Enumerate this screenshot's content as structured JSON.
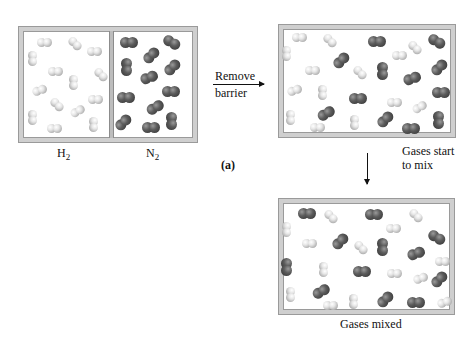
{
  "figure": {
    "panel_label": "(a)",
    "step1": {
      "label_line1": "Remove",
      "label_line2": "barrier"
    },
    "step2": {
      "label_line1": "Gases start",
      "label_line2": "to mix"
    },
    "final_caption": "Gases mixed",
    "initial_labels": {
      "left_gas": "H",
      "left_sub": "2",
      "right_gas": "N",
      "right_sub": "2"
    }
  },
  "colors": {
    "hydrogen": "#e0e0e0",
    "nitrogen": "#4a4a4a",
    "box_frame": "#cfcfcf"
  },
  "boxes": {
    "initial": {
      "x": 19,
      "y": 27,
      "w": 178,
      "h": 115,
      "divider_x": 90,
      "molecules": [
        {
          "t": "h",
          "x": 25,
          "y": 15,
          "a": 0
        },
        {
          "t": "h",
          "x": 56,
          "y": 16,
          "a": 45
        },
        {
          "t": "h",
          "x": 75,
          "y": 24,
          "a": 0
        },
        {
          "t": "h",
          "x": 14,
          "y": 31,
          "a": 90
        },
        {
          "t": "h",
          "x": 36,
          "y": 44,
          "a": 0
        },
        {
          "t": "h",
          "x": 82,
          "y": 47,
          "a": 45
        },
        {
          "t": "h",
          "x": 55,
          "y": 55,
          "a": 90
        },
        {
          "t": "h",
          "x": 20,
          "y": 63,
          "a": -20
        },
        {
          "t": "h",
          "x": 76,
          "y": 72,
          "a": 0
        },
        {
          "t": "h",
          "x": 38,
          "y": 77,
          "a": 45
        },
        {
          "t": "h",
          "x": 58,
          "y": 84,
          "a": -30
        },
        {
          "t": "h",
          "x": 14,
          "y": 90,
          "a": 90
        },
        {
          "t": "h",
          "x": 35,
          "y": 101,
          "a": 0
        },
        {
          "t": "h",
          "x": 75,
          "y": 97,
          "a": 90
        },
        {
          "t": "n",
          "x": 110,
          "y": 15,
          "a": 0
        },
        {
          "t": "n",
          "x": 153,
          "y": 15,
          "a": 30
        },
        {
          "t": "n",
          "x": 132,
          "y": 28,
          "a": -45
        },
        {
          "t": "n",
          "x": 108,
          "y": 40,
          "a": 90
        },
        {
          "t": "n",
          "x": 153,
          "y": 40,
          "a": -45
        },
        {
          "t": "n",
          "x": 130,
          "y": 50,
          "a": -20
        },
        {
          "t": "n",
          "x": 152,
          "y": 64,
          "a": 0
        },
        {
          "t": "n",
          "x": 107,
          "y": 70,
          "a": 0
        },
        {
          "t": "n",
          "x": 136,
          "y": 80,
          "a": -30
        },
        {
          "t": "n",
          "x": 104,
          "y": 95,
          "a": -45
        },
        {
          "t": "n",
          "x": 132,
          "y": 100,
          "a": 0
        },
        {
          "t": "n",
          "x": 153,
          "y": 94,
          "a": 90
        }
      ]
    },
    "mixing": {
      "x": 279,
      "y": 25,
      "w": 176,
      "h": 112,
      "molecules": [
        {
          "t": "h",
          "x": 20,
          "y": 12,
          "a": 0
        },
        {
          "t": "h",
          "x": 51,
          "y": 15,
          "a": 45
        },
        {
          "t": "n",
          "x": 98,
          "y": 16,
          "a": 0
        },
        {
          "t": "h",
          "x": 120,
          "y": 30,
          "a": 0
        },
        {
          "t": "h",
          "x": 136,
          "y": 22,
          "a": 45
        },
        {
          "t": "n",
          "x": 158,
          "y": 16,
          "a": 30
        },
        {
          "t": "h",
          "x": 8,
          "y": 28,
          "a": 90
        },
        {
          "t": "n",
          "x": 62,
          "y": 35,
          "a": -45
        },
        {
          "t": "h",
          "x": 33,
          "y": 45,
          "a": 0
        },
        {
          "t": "h",
          "x": 81,
          "y": 47,
          "a": 45
        },
        {
          "t": "n",
          "x": 104,
          "y": 46,
          "a": 90
        },
        {
          "t": "n",
          "x": 133,
          "y": 53,
          "a": -20
        },
        {
          "t": "n",
          "x": 160,
          "y": 42,
          "a": -45
        },
        {
          "t": "h",
          "x": 15,
          "y": 65,
          "a": -20
        },
        {
          "t": "h",
          "x": 44,
          "y": 67,
          "a": 90
        },
        {
          "t": "n",
          "x": 79,
          "y": 73,
          "a": 0
        },
        {
          "t": "h",
          "x": 115,
          "y": 77,
          "a": 0
        },
        {
          "t": "h",
          "x": 140,
          "y": 82,
          "a": -30
        },
        {
          "t": "n",
          "x": 162,
          "y": 67,
          "a": 0
        },
        {
          "t": "n",
          "x": 47,
          "y": 88,
          "a": -30
        },
        {
          "t": "h",
          "x": 12,
          "y": 92,
          "a": 90
        },
        {
          "t": "h",
          "x": 38,
          "y": 102,
          "a": 0
        },
        {
          "t": "h",
          "x": 76,
          "y": 97,
          "a": 90
        },
        {
          "t": "n",
          "x": 106,
          "y": 94,
          "a": -45
        },
        {
          "t": "n",
          "x": 132,
          "y": 103,
          "a": 0
        },
        {
          "t": "n",
          "x": 160,
          "y": 95,
          "a": 90
        }
      ]
    },
    "mixed": {
      "x": 279,
      "y": 199,
      "w": 175,
      "h": 115,
      "molecules": [
        {
          "t": "n",
          "x": 28,
          "y": 14,
          "a": 0
        },
        {
          "t": "h",
          "x": 52,
          "y": 17,
          "a": 45
        },
        {
          "t": "n",
          "x": 95,
          "y": 15,
          "a": 0
        },
        {
          "t": "h",
          "x": 137,
          "y": 16,
          "a": 45
        },
        {
          "t": "h",
          "x": 8,
          "y": 30,
          "a": 90
        },
        {
          "t": "h",
          "x": 114,
          "y": 29,
          "a": 0
        },
        {
          "t": "h",
          "x": 30,
          "y": 44,
          "a": 0
        },
        {
          "t": "n",
          "x": 61,
          "y": 42,
          "a": -45
        },
        {
          "t": "h",
          "x": 82,
          "y": 48,
          "a": 45
        },
        {
          "t": "n",
          "x": 104,
          "y": 48,
          "a": 90
        },
        {
          "t": "n",
          "x": 137,
          "y": 54,
          "a": -20
        },
        {
          "t": "n",
          "x": 158,
          "y": 38,
          "a": 30
        },
        {
          "t": "n",
          "x": 8,
          "y": 68,
          "a": 90
        },
        {
          "t": "h",
          "x": 45,
          "y": 70,
          "a": 90
        },
        {
          "t": "n",
          "x": 83,
          "y": 72,
          "a": 0
        },
        {
          "t": "h",
          "x": 115,
          "y": 74,
          "a": 0
        },
        {
          "t": "h",
          "x": 141,
          "y": 79,
          "a": -20
        },
        {
          "t": "h",
          "x": 163,
          "y": 62,
          "a": 0
        },
        {
          "t": "n",
          "x": 160,
          "y": 80,
          "a": -45
        },
        {
          "t": "h",
          "x": 12,
          "y": 95,
          "a": 90
        },
        {
          "t": "n",
          "x": 42,
          "y": 92,
          "a": -30
        },
        {
          "t": "h",
          "x": 51,
          "y": 106,
          "a": 0
        },
        {
          "t": "h",
          "x": 75,
          "y": 102,
          "a": 90
        },
        {
          "t": "n",
          "x": 106,
          "y": 100,
          "a": -45
        },
        {
          "t": "n",
          "x": 137,
          "y": 103,
          "a": 0
        },
        {
          "t": "h",
          "x": 165,
          "y": 103,
          "a": -20
        }
      ]
    }
  }
}
